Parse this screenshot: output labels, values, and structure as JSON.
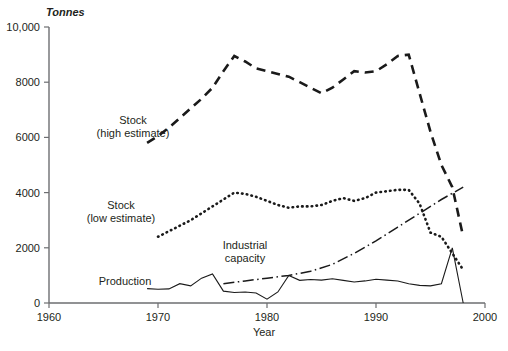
{
  "chart_data": {
    "type": "line",
    "title": "",
    "xlabel": "Year",
    "ylabel": "",
    "unit_label": "Tonnes",
    "xlim": [
      1960,
      2000
    ],
    "ylim": [
      0,
      10000
    ],
    "xticks": [
      1960,
      1970,
      1980,
      1990,
      2000
    ],
    "xtick_labels": [
      "1960",
      "1970",
      "1980",
      "1990",
      "2000"
    ],
    "yticks": [
      0,
      2000,
      4000,
      6000,
      8000,
      10000
    ],
    "ytick_labels": [
      "0",
      "2000",
      "4000",
      "6000",
      "8000",
      "10,000"
    ],
    "grid": false,
    "legend_position": "inline-annotations",
    "series": [
      {
        "name": "Stock (high estimate)",
        "style": "dashed",
        "x": [
          1969,
          1970,
          1971,
          1972,
          1973,
          1974,
          1975,
          1976,
          1977,
          1978,
          1979,
          1980,
          1981,
          1982,
          1983,
          1984,
          1985,
          1986,
          1987,
          1988,
          1989,
          1990,
          1991,
          1992,
          1993,
          1994,
          1995,
          1996,
          1997,
          1998
        ],
        "values": [
          5800,
          6050,
          6350,
          6700,
          7050,
          7400,
          7800,
          8400,
          8950,
          8750,
          8500,
          8400,
          8300,
          8200,
          8000,
          7800,
          7600,
          7800,
          8100,
          8400,
          8350,
          8400,
          8650,
          8950,
          9000,
          7600,
          6200,
          5000,
          4200,
          2400
        ]
      },
      {
        "name": "Stock (low estimate)",
        "style": "dotted",
        "x": [
          1970,
          1971,
          1972,
          1973,
          1974,
          1975,
          1976,
          1977,
          1978,
          1979,
          1980,
          1981,
          1982,
          1983,
          1984,
          1985,
          1986,
          1987,
          1988,
          1989,
          1990,
          1991,
          1992,
          1993,
          1994,
          1995,
          1996,
          1997,
          1998
        ],
        "values": [
          2400,
          2600,
          2800,
          3000,
          3250,
          3500,
          3750,
          4000,
          3950,
          3850,
          3700,
          3550,
          3450,
          3500,
          3500,
          3550,
          3700,
          3800,
          3700,
          3800,
          4000,
          4050,
          4100,
          4100,
          3600,
          2550,
          2400,
          1800,
          1200
        ]
      },
      {
        "name": "Industrial capacity",
        "style": "dash-dot",
        "x": [
          1976,
          1978,
          1980,
          1982,
          1984,
          1986,
          1988,
          1990,
          1992,
          1994,
          1996,
          1998
        ],
        "values": [
          700,
          800,
          900,
          1000,
          1150,
          1400,
          1800,
          2250,
          2750,
          3250,
          3750,
          4200
        ]
      },
      {
        "name": "Production",
        "style": "solid",
        "x": [
          1969,
          1970,
          1971,
          1972,
          1973,
          1974,
          1975,
          1976,
          1977,
          1978,
          1979,
          1980,
          1981,
          1982,
          1983,
          1984,
          1985,
          1986,
          1987,
          1988,
          1989,
          1990,
          1991,
          1992,
          1993,
          1994,
          1995,
          1996,
          1997,
          1998
        ],
        "values": [
          520,
          500,
          510,
          700,
          620,
          900,
          1050,
          430,
          380,
          400,
          360,
          140,
          400,
          1000,
          820,
          850,
          830,
          880,
          820,
          760,
          800,
          860,
          830,
          800,
          700,
          640,
          620,
          700,
          2000,
          0
        ]
      }
    ],
    "annotations": [
      {
        "name": "stock-high-label",
        "lines": [
          "Stock",
          "(high estimate)"
        ],
        "x": 1968.8,
        "y": 6050
      },
      {
        "name": "stock-low-label",
        "lines": [
          "Stock",
          "(low estimate)"
        ],
        "x": 1968.8,
        "y": 2850
      },
      {
        "name": "industrial-capacity-label",
        "lines": [
          "Industrial",
          "capacity"
        ],
        "x": 1981.5,
        "y": 1850
      },
      {
        "name": "production-label",
        "lines": [
          "Production"
        ],
        "x": 1973.0,
        "y": 760
      }
    ]
  },
  "axes": {
    "x_axis_title": "Year",
    "y_unit": "Tonnes",
    "x_tick_0": "1960",
    "x_tick_1": "1970",
    "x_tick_2": "1980",
    "x_tick_3": "1990",
    "x_tick_4": "2000",
    "y_tick_0": "0",
    "y_tick_1": "2000",
    "y_tick_2": "4000",
    "y_tick_3": "6000",
    "y_tick_4": "8000",
    "y_tick_5": "10,000"
  },
  "labels": {
    "stock_high_line1": "Stock",
    "stock_high_line2": "(high estimate)",
    "stock_low_line1": "Stock",
    "stock_low_line2": "(low estimate)",
    "industrial_line1": "Industrial",
    "industrial_line2": "capacity",
    "production": "Production"
  },
  "colors": {
    "ink": "#1a1a1a",
    "axis": "#6d6e71",
    "background": "#ffffff"
  }
}
